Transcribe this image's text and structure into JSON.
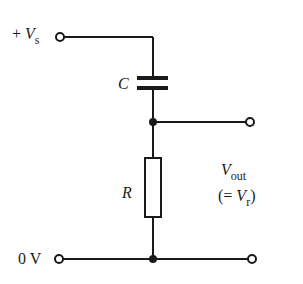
{
  "diagram": {
    "type": "RC high-pass circuit",
    "labels": {
      "vs_plus": "+",
      "vs_symbol": "V",
      "vs_sub": "s",
      "capacitor": "C",
      "resistor": "R",
      "vout_symbol": "V",
      "vout_sub": "out",
      "vr_open": "(= ",
      "vr_symbol": "V",
      "vr_sub": "r",
      "vr_close": ")",
      "ground": "0 V"
    },
    "colors": {
      "line": "#1a1a1a",
      "background": "#ffffff"
    }
  }
}
